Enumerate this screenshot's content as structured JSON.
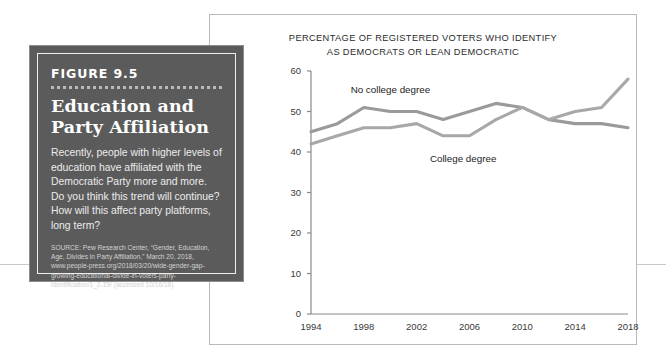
{
  "figure": {
    "label": "FIGURE 9.5",
    "title_line1": "Education and",
    "title_line2": "Party Affiliation",
    "body": "Recently, people with higher levels of education have affiliated with the Democratic Party more and more. Do you think this trend will continue? How will this affect party platforms, long term?",
    "source": "SOURCE: Pew Research Center, “Gender, Education, Age, Divides in Party Affiliation,” March 20, 2018, www.people-press.org/2018/03/20/wide-gender-gap-growing-educational-divide-in-voters-party-identification/1_2-19/ (accessed 10/16/18).",
    "colors": {
      "box_background": "#5b5b5b",
      "box_border": "#8d8d8d",
      "inner_rule": "#eeeeee",
      "title_text": "#ffffff",
      "body_text": "#ececec",
      "source_text": "#d2d2d2"
    }
  },
  "chart_data": {
    "type": "line",
    "title": "PERCENTAGE OF REGISTERED VOTERS WHO IDENTIFY AS DEMOCRATS OR LEAN DEMOCRATIC",
    "title_line1": "PERCENTAGE OF REGISTERED VOTERS WHO IDENTIFY",
    "title_line2": "AS DEMOCRATS OR LEAN DEMOCRATIC",
    "xlabel": "",
    "ylabel": "",
    "xlim": [
      1994,
      2018
    ],
    "ylim": [
      0,
      60
    ],
    "grid": false,
    "legend_position": "inline-annotations",
    "x_tick_labels": [
      "1994",
      "1998",
      "2002",
      "2006",
      "2010",
      "2014",
      "2018"
    ],
    "y_tick_labels": [
      "0",
      "10",
      "20",
      "30",
      "40",
      "50",
      "60"
    ],
    "x": [
      1994,
      1996,
      1998,
      2000,
      2002,
      2004,
      2006,
      2008,
      2010,
      2012,
      2014,
      2016,
      2018
    ],
    "series": [
      {
        "name": "No college degree",
        "color": "#9a9a9a",
        "values": [
          45,
          47,
          51,
          50,
          50,
          48,
          50,
          52,
          51,
          48,
          47,
          47,
          46
        ]
      },
      {
        "name": "College degree",
        "color": "#a8a8a8",
        "values": [
          42,
          44,
          46,
          46,
          47,
          44,
          44,
          48,
          51,
          48,
          50,
          51,
          58
        ]
      }
    ],
    "annotations": [
      {
        "text": "No college degree",
        "x": 1997,
        "y": 55
      },
      {
        "text": "College degree",
        "x": 2003,
        "y": 38
      }
    ],
    "axis_color": "#8a8a8a",
    "tick_text_color": "#3a3a3a"
  }
}
